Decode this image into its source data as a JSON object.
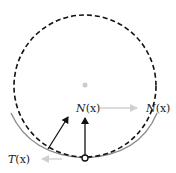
{
  "diagram": {
    "labels": {
      "normal_left": {
        "italic": "N",
        "rest": "(x)"
      },
      "normal_right": {
        "italic": "N",
        "rest": "(x)"
      },
      "tangent": {
        "italic": "T",
        "rest": "(x)"
      }
    },
    "colors": {
      "dashed_circle": "#111111",
      "solid_arc": "#8a8a8a",
      "arrow_dark": "#111111",
      "arrow_light": "#d0d0d0",
      "center_dot": "#cccccc"
    },
    "geometry": {
      "circle_center": [
        85,
        86
      ],
      "circle_radius": 71,
      "contact_point": [
        85,
        158
      ]
    }
  }
}
